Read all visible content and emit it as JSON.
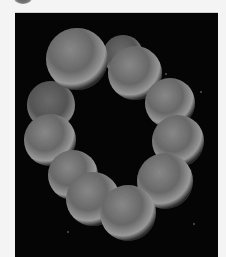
{
  "image": {
    "subject": "ring-shaped chain of spherical cocci (SEM micrograph)",
    "background_color": "#050505",
    "frame_color": "#f4f4f4",
    "cell_count": 14,
    "cells": [
      {
        "cx": 62,
        "cy": 46,
        "r": 31
      },
      {
        "cx": 108,
        "cy": 44,
        "r": 20
      },
      {
        "cx": 118,
        "cy": 58,
        "r": 26
      },
      {
        "cx": 155,
        "cy": 88,
        "r": 25
      },
      {
        "cx": 163,
        "cy": 128,
        "r": 26
      },
      {
        "cx": 150,
        "cy": 168,
        "r": 28
      },
      {
        "cx": 112,
        "cy": 198,
        "r": 27
      },
      {
        "cx": 78,
        "cy": 186,
        "r": 27
      },
      {
        "cx": 58,
        "cy": 162,
        "r": 25
      },
      {
        "cx": 35,
        "cy": 127,
        "r": 26
      },
      {
        "cx": 36,
        "cy": 92,
        "r": 24
      }
    ]
  }
}
